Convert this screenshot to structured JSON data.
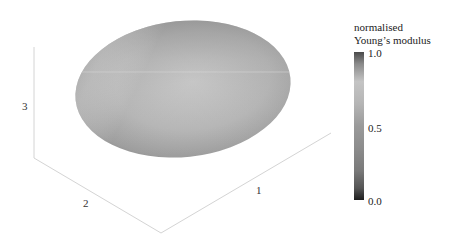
{
  "figure": {
    "type": "3d-surface-ellipsoid",
    "axes": {
      "x_label": "1",
      "y_label": "2",
      "z_label": "3"
    },
    "colorbar": {
      "title_line1": "normalised",
      "title_line2": "Young’s modulus",
      "ticks": [
        "1.0",
        "0.5",
        "0.0"
      ],
      "colormap": "grayscale",
      "colors": {
        "top": "#4a4a4a",
        "high_light": "#c4c4c4",
        "mid": "#9a9a9a",
        "bottom": "#1e1e1e"
      }
    },
    "colors": {
      "axis_line": "#d0d0d0",
      "surface_light": "#c8c8c8",
      "surface_mid": "#a8a8a8",
      "surface_dark": "#1a1a1a"
    }
  }
}
